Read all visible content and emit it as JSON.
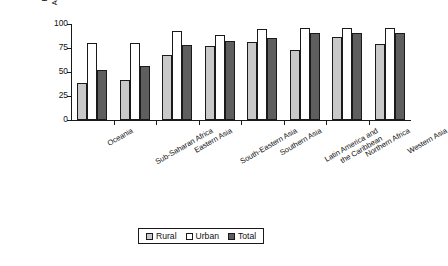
{
  "chart_data": {
    "type": "bar",
    "title": "",
    "xlabel": "",
    "ylabel": "Proportion of Population with Sustainable Access to an Improved Water Source, 2004",
    "ylim": [
      0,
      100
    ],
    "yticks": [
      0,
      25,
      50,
      75,
      100
    ],
    "ytick_labels": [
      "0",
      "25",
      "50",
      "75",
      "100"
    ],
    "grid": false,
    "legend_position": "bottom",
    "categories": [
      "Oceania",
      "Sub-Saharan Africa",
      "Eastern Asia",
      "South-Eastern Asia",
      "Southern Asia",
      "Latin America and the Caribbean",
      "Northern Africa",
      "Western Asia"
    ],
    "category_lines": [
      [
        "Oceania"
      ],
      [
        "Sub-Saharan Africa"
      ],
      [
        "Eastern Asia"
      ],
      [
        "South-Eastern Asia"
      ],
      [
        "Southern Asia"
      ],
      [
        "Latin America and",
        "the Caribbean"
      ],
      [
        "Northern Africa"
      ],
      [
        "Western Asia"
      ]
    ],
    "series": [
      {
        "name": "Rural",
        "color": "#c9c9c9",
        "values": [
          39,
          42,
          68,
          77,
          81,
          73,
          86,
          79
        ]
      },
      {
        "name": "Urban",
        "color": "#ffffff",
        "values": [
          80,
          80,
          93,
          89,
          95,
          96,
          96,
          96
        ]
      },
      {
        "name": "Total",
        "color": "#5e5e5e",
        "values": [
          52,
          56,
          78,
          82,
          85,
          91,
          91,
          91
        ]
      }
    ]
  },
  "legend": {
    "items": [
      {
        "label": "Rural",
        "color": "#c9c9c9"
      },
      {
        "label": "Urban",
        "color": "#ffffff"
      },
      {
        "label": "Total",
        "color": "#5e5e5e"
      }
    ]
  }
}
